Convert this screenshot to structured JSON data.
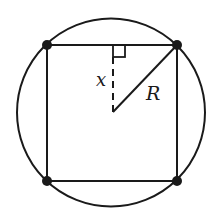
{
  "diagram": {
    "colors": {
      "stroke": "#1a1a1a",
      "background": "#ffffff"
    },
    "circle": {
      "cx": 111,
      "cy": 112,
      "r": 94
    },
    "square": {
      "vertices": [
        {
          "name": "top-left",
          "x": 47,
          "y": 45
        },
        {
          "name": "top-right",
          "x": 177,
          "y": 45
        },
        {
          "name": "bottom-right",
          "x": 177,
          "y": 181
        },
        {
          "name": "bottom-left",
          "x": 47,
          "y": 181
        }
      ]
    },
    "center": {
      "x": 113,
      "y": 112
    },
    "labels": {
      "x": "x",
      "R": "R"
    }
  }
}
